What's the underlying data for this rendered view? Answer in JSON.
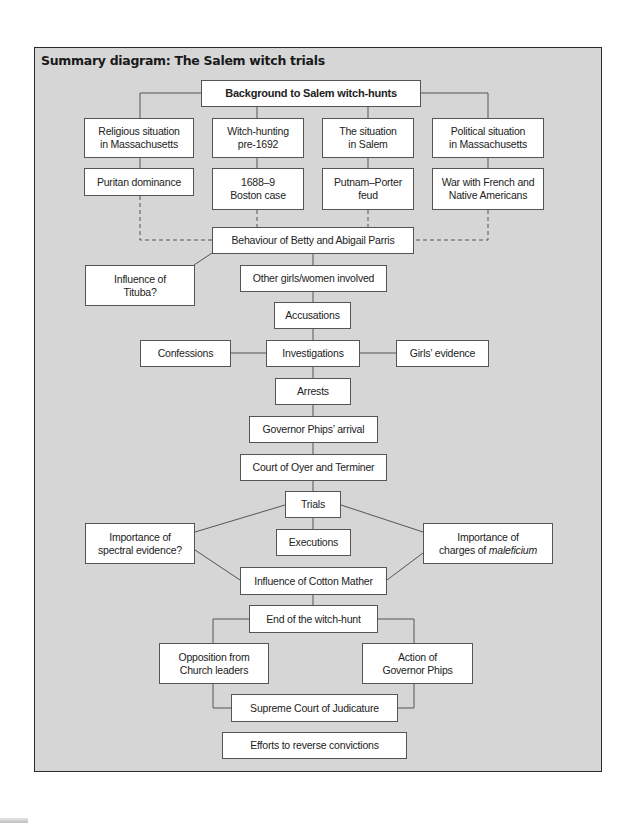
{
  "diagram": {
    "title": "Summary diagram: The Salem witch trials",
    "colors": {
      "panel": "#d6d6d6",
      "box": "#ffffff",
      "line": "#555555",
      "frame": "#2b2b2b"
    },
    "nodes": [
      {
        "id": "background",
        "label": "Background to Salem witch-hunts",
        "bold": true,
        "x": 201,
        "y": 80,
        "w": 220,
        "h": 27
      },
      {
        "id": "religious",
        "label": "Religious situation\nin Massachusetts",
        "x": 84,
        "y": 118,
        "w": 110,
        "h": 40
      },
      {
        "id": "witchhunting",
        "label": "Witch-hunting\npre-1692",
        "x": 212,
        "y": 118,
        "w": 92,
        "h": 40
      },
      {
        "id": "salem",
        "label": "The situation\nin Salem",
        "x": 322,
        "y": 118,
        "w": 92,
        "h": 40
      },
      {
        "id": "political",
        "label": "Political situation\nin Massachusetts",
        "x": 432,
        "y": 118,
        "w": 112,
        "h": 40
      },
      {
        "id": "puritan",
        "label": "Puritan dominance",
        "x": 84,
        "y": 168,
        "w": 110,
        "h": 28
      },
      {
        "id": "boston",
        "label": "1688–9\nBoston case",
        "x": 212,
        "y": 168,
        "w": 92,
        "h": 42
      },
      {
        "id": "putnam",
        "label": "Putnam–Porter\nfeud",
        "x": 322,
        "y": 168,
        "w": 92,
        "h": 42
      },
      {
        "id": "war",
        "label": "War with French and\nNative Americans",
        "x": 432,
        "y": 168,
        "w": 112,
        "h": 42
      },
      {
        "id": "behaviour",
        "label": "Behaviour of Betty and Abigail Parris",
        "x": 212,
        "y": 227,
        "w": 202,
        "h": 27
      },
      {
        "id": "tituba",
        "label": "Influence of\nTituba?",
        "x": 85,
        "y": 265,
        "w": 110,
        "h": 41
      },
      {
        "id": "othergirls",
        "label": "Other girls/women involved",
        "x": 240,
        "y": 265,
        "w": 147,
        "h": 27
      },
      {
        "id": "accusations",
        "label": "Accusations",
        "x": 274,
        "y": 302,
        "w": 77,
        "h": 27
      },
      {
        "id": "confessions",
        "label": "Confessions",
        "x": 140,
        "y": 340,
        "w": 91,
        "h": 27
      },
      {
        "id": "investigations",
        "label": "Investigations",
        "x": 266,
        "y": 340,
        "w": 94,
        "h": 27
      },
      {
        "id": "girlsevidence",
        "label": "Girls’ evidence",
        "x": 396,
        "y": 340,
        "w": 93,
        "h": 27
      },
      {
        "id": "arrests",
        "label": "Arrests",
        "x": 275,
        "y": 378,
        "w": 76,
        "h": 27
      },
      {
        "id": "governorarrival",
        "label": "Governor Phips’ arrival",
        "x": 249,
        "y": 416,
        "w": 129,
        "h": 27
      },
      {
        "id": "oyer",
        "label": "Court of Oyer and Terminer",
        "x": 240,
        "y": 454,
        "w": 147,
        "h": 27
      },
      {
        "id": "trials",
        "label": "Trials",
        "x": 285,
        "y": 491,
        "w": 56,
        "h": 27
      },
      {
        "id": "spectral",
        "label": "Importance of\nspectral evidence?",
        "x": 85,
        "y": 523,
        "w": 110,
        "h": 41
      },
      {
        "id": "executions",
        "label": "Executions",
        "x": 276,
        "y": 529,
        "w": 75,
        "h": 27
      },
      {
        "id": "maleficium",
        "label": "Importance of\ncharges of ",
        "italic_suffix": "maleficium",
        "x": 423,
        "y": 523,
        "w": 130,
        "h": 41
      },
      {
        "id": "cottonmather",
        "label": "Influence of Cotton Mather",
        "x": 240,
        "y": 567,
        "w": 147,
        "h": 28
      },
      {
        "id": "endhunt",
        "label": "End of the witch-hunt",
        "x": 249,
        "y": 605,
        "w": 129,
        "h": 28
      },
      {
        "id": "opposition",
        "label": "Opposition from\nChurch leaders",
        "x": 159,
        "y": 643,
        "w": 110,
        "h": 41
      },
      {
        "id": "actionphips",
        "label": "Action of\nGovernor Phips",
        "x": 362,
        "y": 643,
        "w": 111,
        "h": 41
      },
      {
        "id": "supreme",
        "label": "Supreme Court of Judicature",
        "x": 231,
        "y": 694,
        "w": 167,
        "h": 28
      },
      {
        "id": "efforts",
        "label": "Efforts to reverse convictions",
        "x": 222,
        "y": 732,
        "w": 185,
        "h": 27
      }
    ],
    "edges": [
      {
        "from": "background",
        "to": "religious",
        "points": [
          [
            201,
            93
          ],
          [
            140,
            93
          ],
          [
            140,
            118
          ]
        ],
        "style": "solid"
      },
      {
        "from": "background",
        "to": "witchhunting",
        "points": [
          [
            257,
            107
          ],
          [
            257,
            118
          ]
        ],
        "style": "solid"
      },
      {
        "from": "background",
        "to": "salem",
        "points": [
          [
            368,
            107
          ],
          [
            368,
            118
          ]
        ],
        "style": "solid"
      },
      {
        "from": "background",
        "to": "political",
        "points": [
          [
            421,
            93
          ],
          [
            488,
            93
          ],
          [
            488,
            118
          ]
        ],
        "style": "solid"
      },
      {
        "from": "religious",
        "to": "puritan",
        "points": [
          [
            140,
            158
          ],
          [
            140,
            168
          ]
        ],
        "style": "solid"
      },
      {
        "from": "witchhunting",
        "to": "boston",
        "points": [
          [
            257,
            158
          ],
          [
            257,
            168
          ]
        ],
        "style": "solid"
      },
      {
        "from": "salem",
        "to": "putnam",
        "points": [
          [
            368,
            158
          ],
          [
            368,
            168
          ]
        ],
        "style": "solid"
      },
      {
        "from": "political",
        "to": "war",
        "points": [
          [
            488,
            158
          ],
          [
            488,
            168
          ]
        ],
        "style": "solid"
      },
      {
        "from": "puritan",
        "to": "behaviour",
        "points": [
          [
            140,
            196
          ],
          [
            140,
            240
          ],
          [
            212,
            240
          ]
        ],
        "style": "dashed"
      },
      {
        "from": "boston",
        "to": "behaviour",
        "points": [
          [
            257,
            210
          ],
          [
            257,
            227
          ]
        ],
        "style": "dashed"
      },
      {
        "from": "putnam",
        "to": "behaviour",
        "points": [
          [
            368,
            210
          ],
          [
            368,
            227
          ]
        ],
        "style": "dashed"
      },
      {
        "from": "war",
        "to": "behaviour",
        "points": [
          [
            488,
            210
          ],
          [
            488,
            240
          ],
          [
            414,
            240
          ]
        ],
        "style": "dashed"
      },
      {
        "from": "behaviour",
        "to": "tituba",
        "points": [
          [
            212,
            253
          ],
          [
            194,
            265
          ]
        ],
        "style": "solid"
      },
      {
        "from": "behaviour",
        "to": "othergirls",
        "points": [
          [
            313,
            254
          ],
          [
            313,
            265
          ]
        ],
        "style": "solid"
      },
      {
        "from": "othergirls",
        "to": "accusations",
        "points": [
          [
            313,
            292
          ],
          [
            313,
            302
          ]
        ],
        "style": "solid"
      },
      {
        "from": "accusations",
        "to": "investigations",
        "points": [
          [
            313,
            329
          ],
          [
            313,
            340
          ]
        ],
        "style": "solid"
      },
      {
        "from": "confessions",
        "to": "investigations",
        "points": [
          [
            231,
            353
          ],
          [
            266,
            353
          ]
        ],
        "style": "solid"
      },
      {
        "from": "investigations",
        "to": "girlsevidence",
        "points": [
          [
            360,
            353
          ],
          [
            396,
            353
          ]
        ],
        "style": "solid"
      },
      {
        "from": "investigations",
        "to": "arrests",
        "points": [
          [
            313,
            367
          ],
          [
            313,
            378
          ]
        ],
        "style": "solid"
      },
      {
        "from": "arrests",
        "to": "governorarrival",
        "points": [
          [
            313,
            405
          ],
          [
            313,
            416
          ]
        ],
        "style": "solid"
      },
      {
        "from": "governorarrival",
        "to": "oyer",
        "points": [
          [
            313,
            443
          ],
          [
            313,
            454
          ]
        ],
        "style": "solid"
      },
      {
        "from": "oyer",
        "to": "trials",
        "points": [
          [
            313,
            481
          ],
          [
            313,
            491
          ]
        ],
        "style": "solid"
      },
      {
        "from": "trials",
        "to": "executions",
        "points": [
          [
            313,
            518
          ],
          [
            313,
            529
          ]
        ],
        "style": "solid"
      },
      {
        "from": "trials",
        "to": "spectral",
        "points": [
          [
            285,
            505
          ],
          [
            195,
            532
          ]
        ],
        "style": "solid"
      },
      {
        "from": "trials",
        "to": "maleficium",
        "points": [
          [
            341,
            505
          ],
          [
            423,
            532
          ]
        ],
        "style": "solid"
      },
      {
        "from": "spectral",
        "to": "cottonmather",
        "points": [
          [
            195,
            550
          ],
          [
            240,
            580
          ]
        ],
        "style": "solid"
      },
      {
        "from": "maleficium",
        "to": "cottonmather",
        "points": [
          [
            423,
            553
          ],
          [
            387,
            580
          ]
        ],
        "style": "solid"
      },
      {
        "from": "cottonmather",
        "to": "endhunt",
        "points": [
          [
            313,
            595
          ],
          [
            313,
            605
          ]
        ],
        "style": "solid"
      },
      {
        "from": "endhunt",
        "to": "opposition",
        "points": [
          [
            249,
            619
          ],
          [
            213,
            619
          ],
          [
            213,
            643
          ]
        ],
        "style": "solid"
      },
      {
        "from": "endhunt",
        "to": "actionphips",
        "points": [
          [
            378,
            619
          ],
          [
            414,
            619
          ],
          [
            414,
            643
          ]
        ],
        "style": "solid"
      },
      {
        "from": "opposition",
        "to": "supreme",
        "points": [
          [
            213,
            684
          ],
          [
            213,
            708
          ],
          [
            231,
            708
          ]
        ],
        "style": "solid"
      },
      {
        "from": "actionphips",
        "to": "supreme",
        "points": [
          [
            414,
            684
          ],
          [
            414,
            708
          ],
          [
            398,
            708
          ]
        ],
        "style": "solid"
      }
    ]
  }
}
